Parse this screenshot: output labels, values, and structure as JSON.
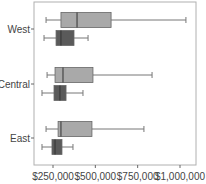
{
  "chart_data": {
    "type": "boxplot",
    "orientation": "horizontal",
    "title": "",
    "xlabel": "",
    "ylabel": "",
    "categories": [
      "West",
      "Central",
      "East"
    ],
    "x_ticks": [
      "$250,000",
      "$500,000",
      "$750,000",
      "$1,000,000"
    ],
    "x_tick_values": [
      250000,
      500000,
      750000,
      1000000
    ],
    "xlim": [
      160000,
      1100000
    ],
    "grid": false,
    "legend": null,
    "series": [
      {
        "name": "series-light",
        "color": "#a9a9a9",
        "boxes": [
          {
            "category": "West",
            "min": 209000,
            "q1": 297000,
            "median": 392000,
            "q3": 593000,
            "max": 1035000
          },
          {
            "category": "Central",
            "min": 215000,
            "q1": 262000,
            "median": 309000,
            "q3": 486000,
            "max": 835000
          },
          {
            "category": "East",
            "min": 209000,
            "q1": 280000,
            "median": 297000,
            "q3": 480000,
            "max": 787000
          }
        ]
      },
      {
        "name": "series-dark",
        "color": "#5a5a5a",
        "boxes": [
          {
            "category": "West",
            "min": 197000,
            "q1": 268000,
            "median": 297000,
            "q3": 374000,
            "max": 457000
          },
          {
            "category": "Central",
            "min": 185000,
            "q1": 256000,
            "median": 291000,
            "q3": 327000,
            "max": 427000
          },
          {
            "category": "East",
            "min": 185000,
            "q1": 244000,
            "median": 262000,
            "q3": 303000,
            "max": 368000
          }
        ]
      }
    ]
  }
}
